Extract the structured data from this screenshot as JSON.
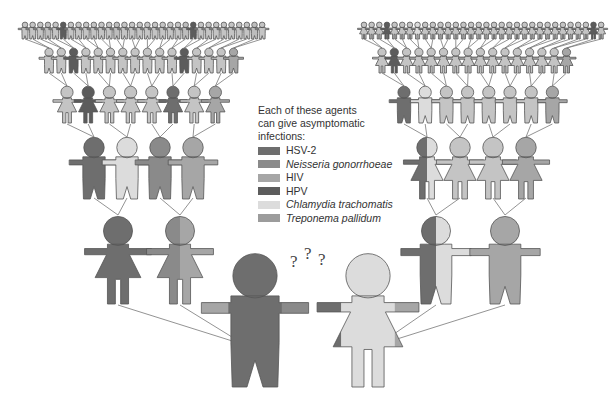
{
  "legend": {
    "title_lines": [
      "Each of these agents",
      "can give asymptomatic",
      "infections:"
    ],
    "items": [
      {
        "label": "HSV-2",
        "color": "#6e6e6e",
        "italic": false
      },
      {
        "label": "Neisseria gonorrhoeae",
        "color": "#8a8a8a",
        "italic": true
      },
      {
        "label": "HIV",
        "color": "#a6a6a6",
        "italic": false
      },
      {
        "label": "HPV",
        "color": "#5c5c5c",
        "italic": false
      },
      {
        "label": "Chlamydia trachomatis",
        "color": "#dcdcdc",
        "italic": true
      },
      {
        "label": "Treponema pallidum",
        "color": "#9c9c9c",
        "italic": false
      }
    ]
  },
  "question_marks": [
    "?",
    "?",
    "?"
  ],
  "colors": {
    "outline": "#555555",
    "line": "#777777",
    "default_fill": "#c8c8c8"
  }
}
